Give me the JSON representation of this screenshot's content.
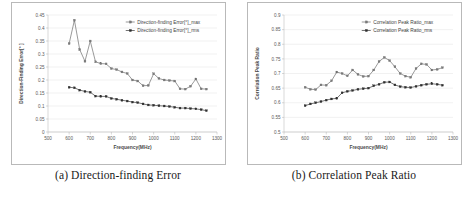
{
  "figure": {
    "panels": [
      {
        "caption": "(a) Direction-finding Error",
        "xlabel": "Frequency(MHz)",
        "ylabel": "Direction-Finding Error[° ]",
        "legend": [
          "Direction-finding Error[°]_max",
          "Direction-finding Error[°]_rms"
        ]
      },
      {
        "caption": "(b) Correlation Peak Ratio",
        "xlabel": "Frequency(MHz)",
        "ylabel": "Correlation Peak Ratio",
        "legend": [
          "Correlation Peak Ratio_max",
          "Correlation Peak Ratio_rms"
        ]
      }
    ]
  },
  "chart_data": [
    {
      "type": "line",
      "title": "(a) Direction-finding Error",
      "xlabel": "Frequency(MHz)",
      "ylabel": "Direction-Finding Error[° ]",
      "xlim": [
        500,
        1300
      ],
      "ylim": [
        0,
        0.45
      ],
      "xticks": [
        500,
        600,
        700,
        800,
        900,
        1000,
        1100,
        1200,
        1300
      ],
      "yticks": [
        0,
        0.05,
        0.1,
        0.15,
        0.2,
        0.25,
        0.3,
        0.35,
        0.4,
        0.45
      ],
      "grid": true,
      "legend_position": "top-right",
      "x": [
        600,
        625,
        650,
        675,
        700,
        725,
        750,
        775,
        800,
        825,
        850,
        875,
        900,
        925,
        950,
        975,
        1000,
        1025,
        1050,
        1075,
        1100,
        1125,
        1150,
        1175,
        1200,
        1225,
        1250
      ],
      "series": [
        {
          "name": "Direction-finding Error[°]_max",
          "values": [
            0.34,
            0.43,
            0.317,
            0.272,
            0.35,
            0.27,
            0.263,
            0.262,
            0.244,
            0.24,
            0.231,
            0.225,
            0.2,
            0.196,
            0.178,
            0.179,
            0.224,
            0.206,
            0.2,
            0.198,
            0.196,
            0.166,
            0.165,
            0.176,
            0.204,
            0.166,
            0.165
          ]
        },
        {
          "name": "Direction-finding Error[°]_rms",
          "values": [
            0.172,
            0.17,
            0.161,
            0.156,
            0.153,
            0.138,
            0.137,
            0.137,
            0.129,
            0.126,
            0.122,
            0.119,
            0.115,
            0.113,
            0.108,
            0.104,
            0.103,
            0.101,
            0.1,
            0.098,
            0.095,
            0.092,
            0.092,
            0.09,
            0.089,
            0.086,
            0.082
          ]
        }
      ]
    },
    {
      "type": "line",
      "title": "(b) Correlation Peak Ratio",
      "xlabel": "Frequency(MHz)",
      "ylabel": "Correlation Peak Ratio",
      "xlim": [
        500,
        1300
      ],
      "ylim": [
        0.5,
        0.9
      ],
      "xticks": [
        500,
        600,
        700,
        800,
        900,
        1000,
        1100,
        1200,
        1300
      ],
      "yticks": [
        0.5,
        0.55,
        0.6,
        0.65,
        0.7,
        0.75,
        0.8,
        0.85,
        0.9
      ],
      "grid": true,
      "legend_position": "top-right",
      "x": [
        600,
        625,
        650,
        675,
        700,
        725,
        750,
        775,
        800,
        825,
        850,
        875,
        900,
        925,
        950,
        975,
        1000,
        1025,
        1050,
        1075,
        1100,
        1125,
        1150,
        1175,
        1200,
        1225,
        1250
      ],
      "series": [
        {
          "name": "Correlation Peak Ratio_max",
          "values": [
            0.653,
            0.646,
            0.645,
            0.661,
            0.66,
            0.675,
            0.705,
            0.7,
            0.692,
            0.712,
            0.697,
            0.69,
            0.691,
            0.712,
            0.741,
            0.755,
            0.744,
            0.723,
            0.7,
            0.691,
            0.687,
            0.717,
            0.733,
            0.731,
            0.712,
            0.714,
            0.72
          ]
        },
        {
          "name": "Correlation Peak Ratio_rms",
          "values": [
            0.59,
            0.596,
            0.6,
            0.604,
            0.609,
            0.613,
            0.615,
            0.634,
            0.639,
            0.642,
            0.646,
            0.648,
            0.65,
            0.658,
            0.663,
            0.67,
            0.671,
            0.661,
            0.655,
            0.653,
            0.652,
            0.656,
            0.66,
            0.663,
            0.665,
            0.663,
            0.66
          ]
        }
      ]
    }
  ]
}
